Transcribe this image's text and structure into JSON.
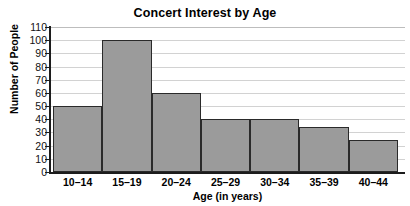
{
  "chart_data": {
    "type": "bar",
    "title": "Concert Interest by Age",
    "xlabel": "Age (in years)",
    "ylabel": "Number of People",
    "categories": [
      "10–14",
      "15–19",
      "20–24",
      "25–29",
      "30–34",
      "35–39",
      "40–44"
    ],
    "values": [
      50,
      100,
      60,
      40,
      40,
      34,
      24
    ],
    "yticks": [
      0,
      10,
      20,
      30,
      40,
      50,
      60,
      70,
      80,
      90,
      100,
      110
    ],
    "ylim": [
      0,
      110
    ],
    "grid": true,
    "legend": false,
    "bar_color": "#9b9b9b",
    "bar_edge_color": "#2a2a2a",
    "grid_color": "#d2d2d2",
    "axis_color": "#1c1c1c",
    "background": "#ffffff"
  }
}
